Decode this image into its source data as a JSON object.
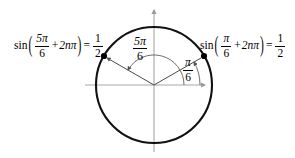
{
  "figure": {
    "colors": {
      "circle": "#000000",
      "axis": "#a8a8a8",
      "radius": "#4a4a4a",
      "arc": "#6e6e6e",
      "point": "#000000",
      "text": "#000000",
      "background": "#ffffff"
    }
  },
  "equations": {
    "left": {
      "function": "sin",
      "open_paren": "(",
      "angle_numerator": "5π",
      "angle_denominator": "6",
      "plus": "+",
      "period_term": "2nπ",
      "close_paren": ")",
      "equals": "=",
      "value_numerator": "1",
      "value_denominator": "2",
      "plain": "sin(5π/6 + 2nπ) = 1/2"
    },
    "right": {
      "function": "sin",
      "open_paren": "(",
      "angle_numerator": "π",
      "angle_denominator": "6",
      "plus": "+",
      "period_term": "2nπ",
      "close_paren": ")",
      "equals": "=",
      "value_numerator": "1",
      "value_denominator": "2",
      "plain": "sin(π/6 + 2nπ) = 1/2"
    }
  },
  "angle_labels": {
    "large": {
      "numerator": "5π",
      "denominator": "6",
      "plain": "5π/6"
    },
    "small": {
      "numerator": "π",
      "denominator": "6",
      "plain": "π/6"
    }
  },
  "geometry": {
    "center_x": 154,
    "center_y": 85,
    "radius": 58,
    "point_left_x": 104,
    "point_left_y": 56,
    "point_right_x": 204,
    "point_right_y": 56,
    "angle_left_degrees": 150,
    "angle_right_degrees": 30,
    "x_axis_from": 85,
    "x_axis_to": 207,
    "y_axis_from": 8,
    "y_axis_to": 152
  }
}
